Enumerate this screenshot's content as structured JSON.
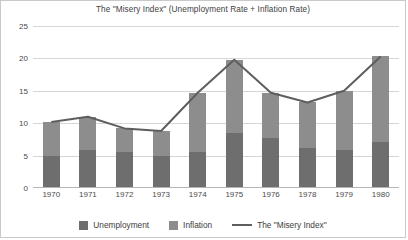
{
  "chart_data": {
    "type": "bar",
    "title": "The \"Misery Index\" (Unemployment Rate + Inflation Rate)",
    "xlabel": "",
    "ylabel": "",
    "ylim": [
      0,
      25
    ],
    "yticks": [
      0,
      5,
      10,
      15,
      20,
      25
    ],
    "grid": true,
    "stacked": true,
    "legend_position": "bottom",
    "categories": [
      "1970",
      "1971",
      "1972",
      "1973",
      "1974",
      "1975",
      "1976",
      "1978",
      "1979",
      "1980"
    ],
    "series": [
      {
        "name": "Unemployment",
        "color": "#6e6e6e",
        "values": [
          4.9,
          5.9,
          5.6,
          4.9,
          5.6,
          8.5,
          7.7,
          6.1,
          5.8,
          7.1
        ]
      },
      {
        "name": "Inflation",
        "color": "#8d8d8d",
        "values": [
          5.3,
          5.1,
          3.6,
          3.9,
          9.1,
          11.3,
          7.0,
          7.1,
          9.2,
          13.2
        ]
      }
    ],
    "line_series": {
      "name": "The \"Misery Index\"",
      "color": "#5e5e5e",
      "values": [
        10.2,
        11.0,
        9.2,
        8.8,
        14.7,
        19.8,
        14.7,
        13.2,
        15.0,
        20.3
      ]
    },
    "legend": [
      {
        "label": "Unemployment",
        "marker": "swatch",
        "color": "#6e6e6e"
      },
      {
        "label": "Inflation",
        "marker": "swatch",
        "color": "#8d8d8d"
      },
      {
        "label": "The \"Misery Index\"",
        "marker": "line",
        "color": "#5e5e5e"
      }
    ]
  }
}
